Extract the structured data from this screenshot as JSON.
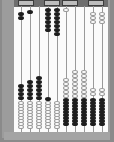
{
  "colors": {
    "frame": "#8a8a8a",
    "topbar": "#6e6e6e",
    "board": "#fbfbfb",
    "bead_dark": "#1e1e1e",
    "bead_light": "#ffffff"
  },
  "compartments": [
    {
      "x": 18,
      "w": 16
    },
    {
      "x": 44,
      "w": 16
    },
    {
      "x": 62,
      "w": 16
    },
    {
      "x": 88,
      "w": 16
    }
  ],
  "rods": [
    {
      "x": 21,
      "beads": [
        {
          "c": "black",
          "y": [
            12,
            16
          ]
        },
        {
          "c": "black",
          "y": [
            84,
            88,
            92,
            96
          ]
        },
        {
          "c": "white",
          "y": [
            101,
            104,
            107,
            110,
            113,
            116,
            119,
            122,
            125
          ]
        }
      ]
    },
    {
      "x": 30,
      "beads": [
        {
          "c": "black",
          "y": [
            10
          ]
        },
        {
          "c": "black",
          "y": [
            80,
            84,
            88,
            92,
            96
          ]
        },
        {
          "c": "white",
          "y": [
            101,
            104,
            107,
            110,
            113,
            116,
            119,
            122,
            125
          ]
        }
      ]
    },
    {
      "x": 39,
      "beads": [
        {
          "c": "black",
          "y": [
            76,
            80,
            84,
            88,
            92,
            96
          ]
        },
        {
          "c": "white",
          "y": [
            101,
            104,
            107,
            110,
            113,
            116,
            119,
            122,
            125
          ]
        }
      ]
    },
    {
      "x": 48,
      "beads": [
        {
          "c": "black",
          "y": [
            8,
            12,
            16,
            20,
            24,
            28
          ]
        },
        {
          "c": "black",
          "y": [
            97
          ]
        },
        {
          "c": "white",
          "y": [
            101,
            104,
            107,
            110,
            113,
            116,
            119,
            122,
            125
          ]
        }
      ]
    },
    {
      "x": 57,
      "beads": [
        {
          "c": "black",
          "y": [
            8,
            12,
            16,
            20,
            24,
            28,
            32
          ]
        },
        {
          "c": "white",
          "y": [
            101,
            104,
            107,
            110,
            113,
            116,
            119,
            122,
            125
          ]
        }
      ]
    },
    {
      "x": 66,
      "beads": [
        {
          "c": "white",
          "y": [
            8
          ]
        },
        {
          "c": "white",
          "y": [
            78,
            82,
            86,
            90,
            94
          ]
        },
        {
          "c": "black",
          "y": [
            98,
            101,
            104,
            107,
            110,
            113,
            116,
            119,
            122
          ]
        }
      ]
    },
    {
      "x": 75,
      "beads": [
        {
          "c": "white",
          "y": [
            70,
            74,
            78,
            82,
            86,
            90,
            94
          ]
        },
        {
          "c": "black",
          "y": [
            98,
            101,
            104,
            107,
            110,
            113,
            116,
            119,
            122
          ]
        }
      ]
    },
    {
      "x": 84,
      "beads": [
        {
          "c": "white",
          "y": [
            70,
            74,
            78,
            82,
            86,
            90,
            94
          ]
        },
        {
          "c": "black",
          "y": [
            98,
            101,
            104,
            107,
            110,
            113,
            116,
            119,
            122
          ]
        }
      ]
    },
    {
      "x": 93,
      "beads": [
        {
          "c": "white",
          "y": [
            12,
            16,
            20
          ]
        },
        {
          "c": "white",
          "y": [
            88,
            92
          ]
        },
        {
          "c": "black",
          "y": [
            98,
            101,
            104,
            107,
            110,
            113,
            116,
            119,
            122
          ]
        }
      ]
    },
    {
      "x": 102,
      "beads": [
        {
          "c": "white",
          "y": [
            12,
            16,
            20
          ]
        },
        {
          "c": "white",
          "y": [
            88,
            92
          ]
        },
        {
          "c": "black",
          "y": [
            98,
            101,
            104,
            107,
            110,
            113,
            116,
            119,
            122
          ]
        }
      ]
    }
  ]
}
